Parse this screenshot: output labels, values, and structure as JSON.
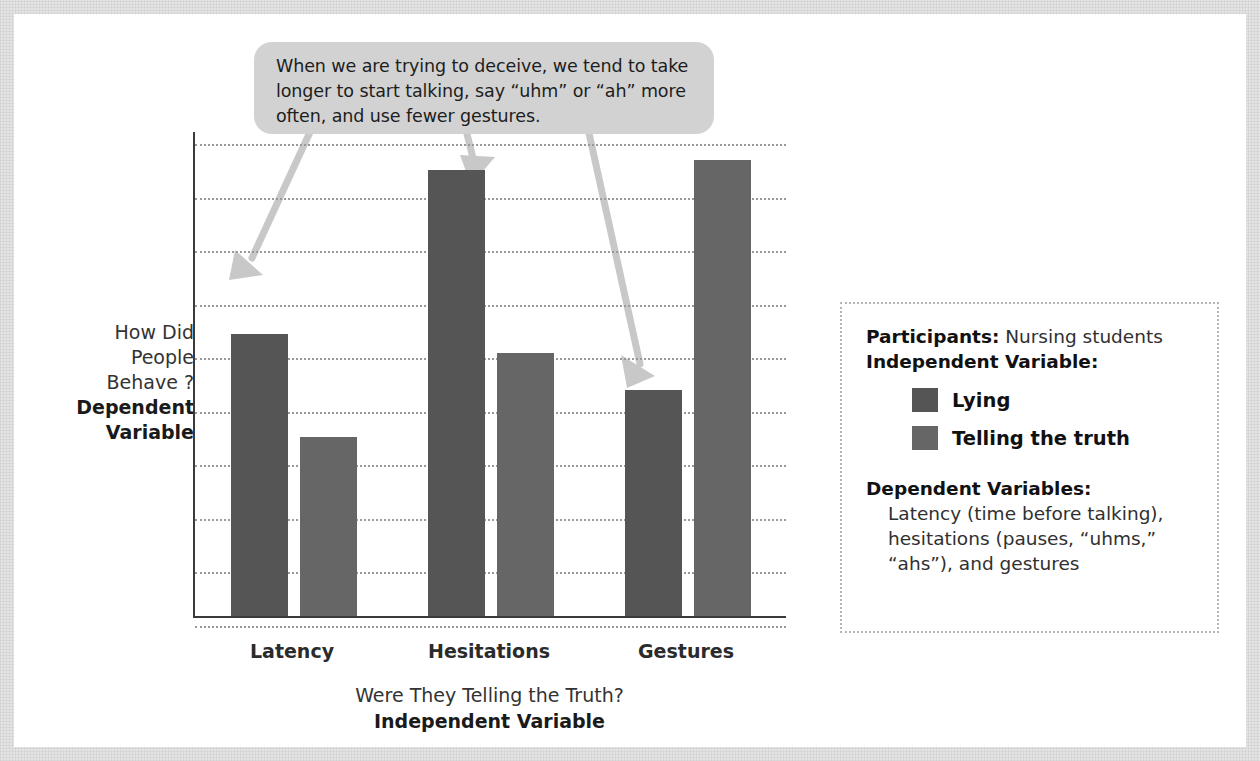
{
  "callout": {
    "text": "When we are trying to deceive, we tend to take longer to start talking, say “uhm” or “ah” more often, and use fewer gestures.",
    "bubble_color": "#d2d2d2",
    "arrow_color": "#c8c8c8"
  },
  "axes": {
    "y_title_plain": "How Did People Behave ?",
    "y_title_bold": "Dependent Variable",
    "x_title_plain": "Were They Telling the Truth?",
    "x_title_bold": "Independent Variable"
  },
  "info": {
    "participants_label": "Participants:",
    "participants_value": "Nursing students",
    "iv_label": "Independent Variable:",
    "dv_label": "Dependent Variables:",
    "dv_value": "Latency (time before talking), hesitations (pauses, “uhms,” “ahs”), and gestures"
  },
  "chart_data": {
    "type": "bar",
    "title": "",
    "xlabel": "Were They Telling the Truth? Independent Variable",
    "ylabel": "How Did People Behave ? Dependent Variable",
    "categories": [
      "Latency",
      "Hesitations",
      "Gestures"
    ],
    "series": [
      {
        "name": "Lying",
        "color": "#555555",
        "values": [
          6.0,
          9.5,
          4.8
        ]
      },
      {
        "name": "Telling the truth",
        "color": "#666666",
        "values": [
          3.8,
          5.6,
          9.7
        ]
      }
    ],
    "ylim": [
      0,
      10.3
    ],
    "grid": true,
    "gridlines": 10,
    "y_ticks_labeled": false,
    "legend": "right"
  }
}
